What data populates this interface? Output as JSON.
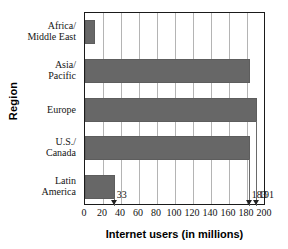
{
  "chart_data": {
    "type": "bar",
    "orientation": "horizontal",
    "title": "",
    "xlabel": "Internet users (in millions)",
    "ylabel": "Region",
    "categories": [
      "Africa/ Middle East",
      "Asia/ Pacific",
      "Europe",
      "U.S./ Canada",
      "Latin America"
    ],
    "category_lines": [
      [
        "Africa/",
        "Middle East"
      ],
      [
        "Asia/",
        "Pacific"
      ],
      [
        "Europe"
      ],
      [
        "U.S./",
        "Canada"
      ],
      [
        "Latin",
        "America"
      ]
    ],
    "values": [
      11,
      183,
      191,
      183,
      33
    ],
    "xlim": [
      0,
      200
    ],
    "xticks": [
      0,
      20,
      40,
      60,
      80,
      100,
      120,
      140,
      160,
      180,
      200
    ],
    "xtick_labels": [
      "0",
      "20",
      "40",
      "60",
      "80",
      "100",
      "120",
      "140",
      "160",
      "180",
      "200"
    ],
    "grid": "vertical",
    "legend": "none",
    "bar_color": "#676767",
    "annotations": [
      {
        "label": "33",
        "value": 33
      },
      {
        "label": "183",
        "value": 183
      },
      {
        "label": "191",
        "value": 191
      }
    ]
  }
}
